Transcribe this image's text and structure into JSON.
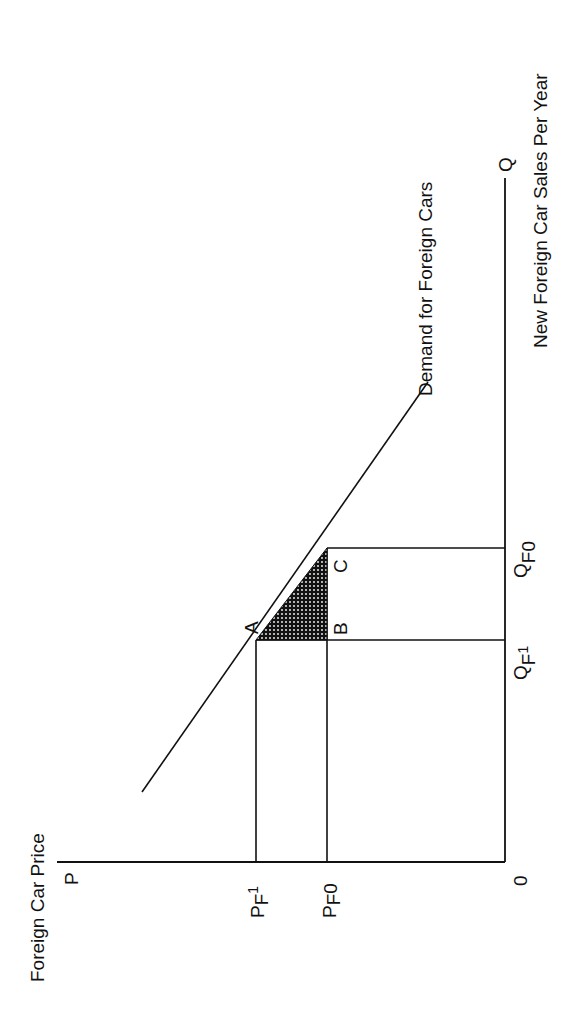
{
  "diagram": {
    "orientation": "rotated 90 degrees counter-clockwise",
    "y_axis": {
      "symbol": "P",
      "title": "Foreign Car Price"
    },
    "x_axis": {
      "symbol": "Q",
      "title": "New Foreign Car Sales Per Year"
    },
    "origin_label": "0",
    "curve": {
      "label": "Demand for Foreign Cars"
    },
    "price_levels": [
      {
        "main": "P",
        "sub": "F",
        "index": "1"
      },
      {
        "main": "P",
        "sub": "F",
        "index": "0"
      }
    ],
    "quantity_levels": [
      {
        "main": "Q",
        "sub": "F",
        "index": "1"
      },
      {
        "main": "Q",
        "sub": "F",
        "index": "0"
      }
    ],
    "points": {
      "a": "A",
      "b": "B",
      "c": "C"
    },
    "shaded_region": "triangle ABC (dotted fill)",
    "colors": {
      "ink": "#111111",
      "background": "#ffffff"
    }
  }
}
